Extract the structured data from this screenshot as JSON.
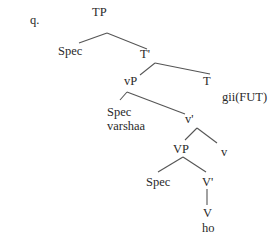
{
  "example_label": "q.",
  "tree": {
    "nodes": [
      {
        "id": "TP",
        "label": "TP"
      },
      {
        "id": "spec_tp",
        "label": "Spec"
      },
      {
        "id": "Tbar",
        "label": "T'"
      },
      {
        "id": "vP",
        "label": "vP"
      },
      {
        "id": "T",
        "label": "T"
      },
      {
        "id": "T_word",
        "label": "gii(FUT)"
      },
      {
        "id": "spec_vp",
        "label": "Spec"
      },
      {
        "id": "spec_vp_word",
        "label": "varshaa"
      },
      {
        "id": "vbar",
        "label": "v'"
      },
      {
        "id": "VP",
        "label": "VP"
      },
      {
        "id": "v",
        "label": "v"
      },
      {
        "id": "spec_VP",
        "label": "Spec"
      },
      {
        "id": "Vbar",
        "label": "V'"
      },
      {
        "id": "V",
        "label": "V"
      },
      {
        "id": "V_word",
        "label": "ho"
      }
    ],
    "edges": [
      [
        "TP",
        "spec_tp"
      ],
      [
        "TP",
        "Tbar"
      ],
      [
        "Tbar",
        "vP"
      ],
      [
        "Tbar",
        "T"
      ],
      [
        "vP",
        "spec_vp"
      ],
      [
        "vP",
        "vbar"
      ],
      [
        "vbar",
        "VP"
      ],
      [
        "vbar",
        "v"
      ],
      [
        "VP",
        "spec_VP"
      ],
      [
        "VP",
        "Vbar"
      ],
      [
        "Vbar",
        "V"
      ]
    ]
  },
  "colors": {
    "text": "#2a2a2a",
    "lines": "#555555",
    "background": "#ffffff"
  }
}
